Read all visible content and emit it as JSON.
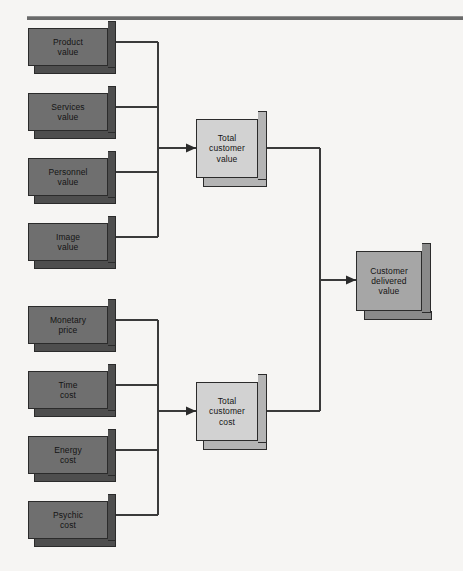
{
  "diagram": {
    "title_rule": "horizontal-rule",
    "background_color": "#f6f5f3",
    "line_color": "#3a3a3a",
    "colors": {
      "input_box": "#6f6f6f",
      "input_box_shade": "#4e4e4e",
      "mid_box": "#d2d2d2",
      "mid_box_shade": "#b4b4b4",
      "output_box": "#a6a6a6",
      "output_box_shade": "#8a8a8a",
      "outline": "#2b2b2b"
    },
    "value_inputs": [
      {
        "line1": "Product",
        "line2": "value"
      },
      {
        "line1": "Services",
        "line2": "value"
      },
      {
        "line1": "Personnel",
        "line2": "value"
      },
      {
        "line1": "Image",
        "line2": "value"
      }
    ],
    "cost_inputs": [
      {
        "line1": "Monetary",
        "line2": "price"
      },
      {
        "line1": "Time",
        "line2": "cost"
      },
      {
        "line1": "Energy",
        "line2": "cost"
      },
      {
        "line1": "Psychic",
        "line2": "cost"
      }
    ],
    "aggregates": [
      {
        "line1": "Total",
        "line2": "customer",
        "line3": "value"
      },
      {
        "line1": "Total",
        "line2": "customer",
        "line3": "cost"
      }
    ],
    "result": {
      "line1": "Customer",
      "line2": "delivered",
      "line3": "value"
    }
  }
}
